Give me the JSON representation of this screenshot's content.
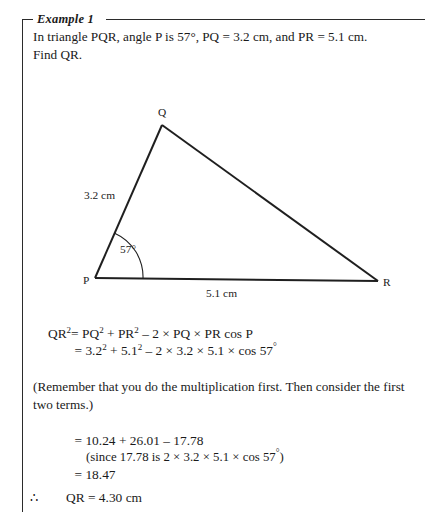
{
  "example": {
    "title": "Example 1",
    "problem_line_1": "In triangle PQR, angle P is 57°, PQ = 3.2 cm, and PR = 5.1 cm.",
    "problem_line_2": "Find QR."
  },
  "diagram": {
    "type": "triangle",
    "vertices": {
      "q_label": "Q",
      "p_label": "P",
      "r_label": "R"
    },
    "side_labels": {
      "pq": "3.2 cm",
      "pr": "5.1 cm"
    },
    "angle_label": "57°",
    "stroke_color": "#1f1f1f"
  },
  "working": {
    "equation_line_1": {
      "lhs": "QR",
      "lhs_exp": "2",
      "rhs_part_1": "= PQ",
      "rhs_exp_1": "2",
      "rhs_part_2": " + PR",
      "rhs_exp_2": "2",
      "rhs_part_3": " – 2 × PQ × PR cos P"
    },
    "equation_line_2": {
      "part_1": "= 3.2",
      "exp_1": "2",
      "part_2": " + 5.1",
      "exp_2": "2",
      "part_3": " – 2 × 3.2 × 5.1 × cos 57",
      "degree": "°"
    },
    "remember_note_line_1": "(Remember that you do the multiplication first. Then consider the first",
    "remember_note_line_2": "two terms.)",
    "calc_line_1": "= 10.24 + 26.01 – 17.78",
    "calc_line_2": {
      "text": "(since 17.78 is 2 × 3.2 × 5.1 × cos 57",
      "degree": "°",
      "close": ")"
    },
    "calc_line_3": "= 18.47",
    "conclusion": {
      "therefore": "∴",
      "result": "QR = 4.30 cm"
    }
  }
}
